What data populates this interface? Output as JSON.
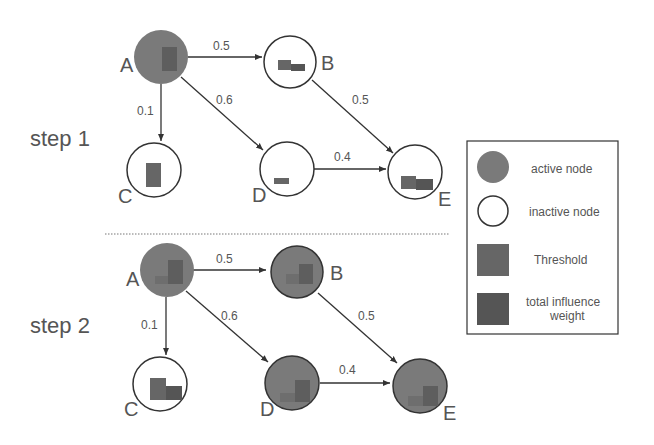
{
  "colors": {
    "active": "#7a7a7a",
    "threshold": "#666666",
    "influence": "#555555",
    "edge": "#333333",
    "text": "#555555"
  },
  "steps": [
    {
      "label": "step 1",
      "nodes": [
        {
          "id": "A",
          "state": "active"
        },
        {
          "id": "B",
          "state": "inactive"
        },
        {
          "id": "C",
          "state": "inactive"
        },
        {
          "id": "D",
          "state": "inactive"
        },
        {
          "id": "E",
          "state": "inactive"
        }
      ],
      "edges": [
        {
          "from": "A",
          "to": "B",
          "weight": "0.5"
        },
        {
          "from": "A",
          "to": "C",
          "weight": "0.1"
        },
        {
          "from": "A",
          "to": "D",
          "weight": "0.6"
        },
        {
          "from": "B",
          "to": "E",
          "weight": "0.5"
        },
        {
          "from": "D",
          "to": "E",
          "weight": "0.4"
        }
      ]
    },
    {
      "label": "step 2",
      "nodes": [
        {
          "id": "A",
          "state": "active"
        },
        {
          "id": "B",
          "state": "active"
        },
        {
          "id": "C",
          "state": "inactive"
        },
        {
          "id": "D",
          "state": "active"
        },
        {
          "id": "E",
          "state": "active"
        }
      ],
      "edges": [
        {
          "from": "A",
          "to": "B",
          "weight": "0.5"
        },
        {
          "from": "A",
          "to": "C",
          "weight": "0.1"
        },
        {
          "from": "A",
          "to": "D",
          "weight": "0.6"
        },
        {
          "from": "B",
          "to": "E",
          "weight": "0.5"
        },
        {
          "from": "D",
          "to": "E",
          "weight": "0.4"
        }
      ]
    }
  ],
  "legend": {
    "active_node": "active node",
    "inactive_node": "inactive node",
    "threshold": "Threshold",
    "influence_line1": "total influence",
    "influence_line2": "weight"
  }
}
